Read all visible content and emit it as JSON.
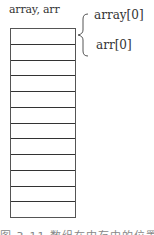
{
  "diagram": {
    "variable_label": "array, arr",
    "cell_count": 12,
    "brace_labels": [
      "array[0]",
      "arr[0]"
    ],
    "caption": "图 3-11  数组在内存中的位置"
  },
  "colors": {
    "line": "#333333",
    "text": "#333333",
    "caption": "#888888"
  }
}
